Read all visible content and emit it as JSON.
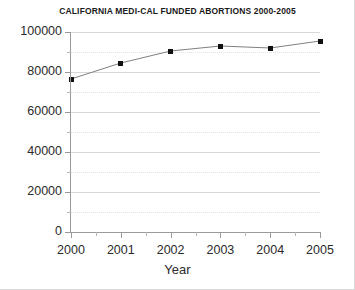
{
  "chart_data": {
    "type": "line",
    "title": "CALIFORNIA MEDI-CAL FUNDED ABORTIONS 2000-2005",
    "xlabel": "Year",
    "ylabel": "",
    "categories": [
      "2000",
      "2001",
      "2002",
      "2003",
      "2004",
      "2005"
    ],
    "values": [
      76500,
      84500,
      90500,
      93000,
      92000,
      95500
    ],
    "series": [
      {
        "name": "Medi-Cal funded abortions",
        "values": [
          76500,
          84500,
          90500,
          93000,
          92000,
          95500
        ]
      }
    ],
    "ylim": [
      0,
      100000
    ],
    "ytick_labels": [
      "0",
      "20000",
      "40000",
      "60000",
      "80000",
      "100000"
    ],
    "ytick_values": [
      0,
      20000,
      40000,
      60000,
      80000,
      100000
    ],
    "yminor_values": [
      10000,
      30000,
      50000,
      70000,
      90000
    ],
    "xtick_labels": [
      "2000",
      "2001",
      "2002",
      "2003",
      "2004",
      "2005"
    ],
    "grid": true,
    "legend": "none",
    "marker": "square",
    "line_color": "#808080",
    "marker_color": "#111111",
    "grid_color": "#d8d8d8"
  }
}
